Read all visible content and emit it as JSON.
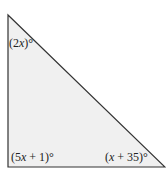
{
  "diagram": {
    "type": "right-triangle",
    "fill_color": "#f0f0f0",
    "stroke_color": "#333333",
    "vertices": {
      "top": [
        8,
        15
      ],
      "bottom_left": [
        8,
        167
      ],
      "bottom_right": [
        165,
        167
      ]
    },
    "angles": {
      "top": {
        "prefix": "(2",
        "var": "x",
        "suffix": ")°"
      },
      "bottom_left": {
        "prefix": "(5",
        "var": "x",
        "suffix": " + 1)°"
      },
      "bottom_right": {
        "prefix": "(",
        "var": "x",
        "suffix": " + 35)°"
      }
    }
  }
}
